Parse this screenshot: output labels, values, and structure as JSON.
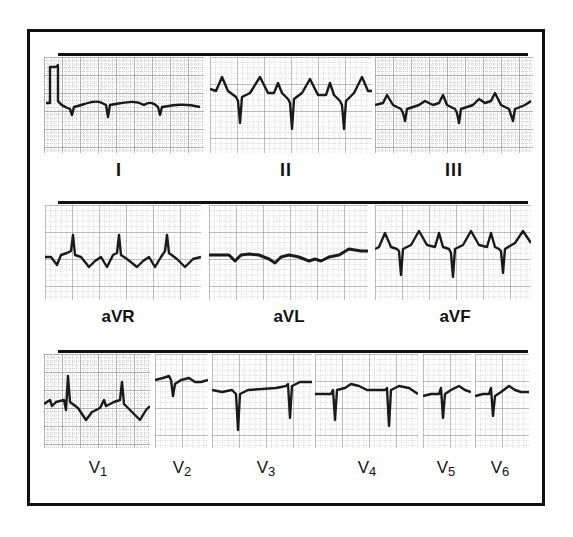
{
  "figure": {
    "rows": [
      {
        "leads": [
          {
            "id": "I",
            "label": "I",
            "note": "calibration pulse at start; low-amplitude QRS"
          },
          {
            "id": "II",
            "label": "II",
            "note": "prominent peaked waves, deep narrow S"
          },
          {
            "id": "III",
            "label": "III",
            "note": "small QRS with peaked waves"
          }
        ]
      },
      {
        "leads": [
          {
            "id": "aVR",
            "label": "aVR",
            "note": "upright narrow R with inverted waves"
          },
          {
            "id": "aVL",
            "label": "aVL",
            "note": "nearly flat, low voltage"
          },
          {
            "id": "aVF",
            "label": "aVF",
            "note": "peaked waves, deep S"
          }
        ]
      },
      {
        "leads": [
          {
            "id": "V1",
            "label": "V",
            "sub": "1",
            "note": "upright R, inverted T"
          },
          {
            "id": "V2",
            "label": "V",
            "sub": "2",
            "note": "QS complex"
          },
          {
            "id": "V3",
            "label": "V",
            "sub": "3",
            "note": "deep QS complexes"
          },
          {
            "id": "V4",
            "label": "V",
            "sub": "4",
            "note": "deep S, small T"
          },
          {
            "id": "V5",
            "label": "V",
            "sub": "5",
            "note": "rS"
          },
          {
            "id": "V6",
            "label": "V",
            "sub": "6",
            "note": "rS"
          }
        ]
      }
    ]
  },
  "colors": {
    "trace": "#1a1a1a",
    "grid_major": "#8a8a8a",
    "grid_minor": "#cfcfcf",
    "frame": "#111111"
  }
}
